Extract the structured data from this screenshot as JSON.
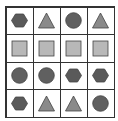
{
  "grid": {
    "rows": 4,
    "cols": 4,
    "cells": [
      [
        "hexagon",
        "triangle",
        "circle",
        "triangle"
      ],
      [
        "square",
        "square",
        "square",
        "square"
      ],
      [
        "circle",
        "circle",
        "hexagon",
        "hexagon"
      ],
      [
        "hexagon",
        "triangle",
        "triangle",
        "circle"
      ]
    ]
  },
  "colors": {
    "hexagon": "#5a5a5a",
    "triangle": "#8a8a8a",
    "circle": "#606060",
    "square": "#b8b8b8",
    "stroke": "#444444",
    "grid_line": "#333333"
  }
}
